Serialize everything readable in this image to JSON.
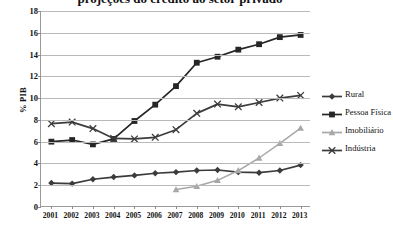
{
  "chart_data": {
    "type": "line",
    "title": "projeções do crédito ao setor privado",
    "xlabel": "",
    "ylabel": "% PIB",
    "categories": [
      "2001",
      "2002",
      "2003",
      "2004",
      "2005",
      "2006",
      "2007",
      "2008",
      "2009",
      "2010",
      "2011",
      "2012",
      "2013"
    ],
    "ylim": [
      0,
      18
    ],
    "ytick_step": 2,
    "yticks": [
      "18",
      "16",
      "14",
      "12",
      "10",
      "8",
      "6",
      "4",
      "2",
      "0"
    ],
    "grid": true,
    "legend_position": "right",
    "series": [
      {
        "name": "Rural",
        "marker": "diamond",
        "color": "#3b3b3b",
        "values": [
          2.2,
          2.15,
          2.55,
          2.75,
          2.9,
          3.1,
          3.2,
          3.35,
          3.4,
          3.2,
          3.15,
          3.35,
          3.85
        ]
      },
      {
        "name": "Pessoa Física",
        "marker": "square",
        "color": "#262626",
        "values": [
          6.0,
          6.15,
          5.75,
          6.25,
          7.9,
          9.4,
          11.1,
          13.25,
          13.8,
          14.45,
          14.95,
          15.6,
          15.8
        ]
      },
      {
        "name": "Imobiliário",
        "marker": "triangle",
        "color": "#a8a8a8",
        "values": [
          null,
          null,
          null,
          null,
          null,
          null,
          1.6,
          1.9,
          2.45,
          3.35,
          4.5,
          5.85,
          7.25
        ]
      },
      {
        "name": "Indústria",
        "marker": "cross",
        "color": "#3b3b3b",
        "values": [
          7.65,
          7.8,
          7.2,
          6.3,
          6.25,
          6.4,
          7.1,
          8.6,
          9.45,
          9.2,
          9.6,
          10.0,
          10.25
        ]
      }
    ]
  }
}
